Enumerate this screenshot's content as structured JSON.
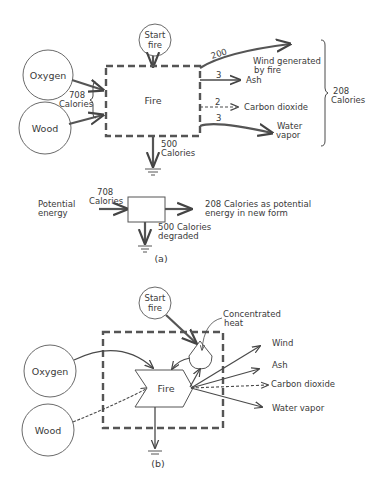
{
  "diagram_a": {
    "start_fire": "Start fire",
    "start_fire_line1": "Start",
    "start_fire_line2": "fire",
    "oxygen": "Oxygen",
    "wood": "Wood",
    "input_value": "708",
    "input_unit": "Calories",
    "process": "Fire",
    "outputs": [
      {
        "value": "200",
        "label_line1": "Wind generated",
        "label_line2": "by fire"
      },
      {
        "value": "3",
        "label_line1": "Ash",
        "label_line2": ""
      },
      {
        "value": "2",
        "label_line1": "Carbon dioxide",
        "label_line2": ""
      },
      {
        "value": "3",
        "label_line1": "Water",
        "label_line2": "vapor"
      }
    ],
    "output_total_value": "208",
    "output_total_unit": "Calories",
    "heat_sink_value": "500",
    "heat_sink_unit": "Calories"
  },
  "summary_a": {
    "left_line1": "Potential",
    "left_line2": "energy",
    "input_value": "708",
    "input_unit": "Calories",
    "output_line1": "208 Calories as potential",
    "output_line2": "energy in new form",
    "degraded_line1": "500 Calories",
    "degraded_line2": "degraded",
    "caption": "(a)"
  },
  "diagram_b": {
    "start_fire_line1": "Start",
    "start_fire_line2": "fire",
    "concentrated_heat_line1": "Concentrated",
    "concentrated_heat_line2": "heat",
    "oxygen": "Oxygen",
    "wood": "Wood",
    "process": "Fire",
    "outputs": [
      "Wind",
      "Ash",
      "Carbon dioxide",
      "Water vapor"
    ],
    "caption": "(b)"
  }
}
